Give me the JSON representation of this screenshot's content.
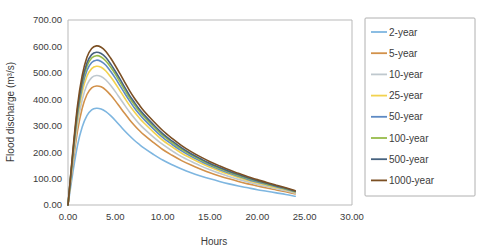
{
  "chart_data": {
    "type": "line",
    "title": "",
    "xlabel": "Hours",
    "ylabel": "Flood discharge (m³/s)",
    "xlim": [
      0,
      30
    ],
    "ylim": [
      0,
      700
    ],
    "xticks": [
      "0.00",
      "5.00",
      "10.00",
      "15.00",
      "20.00",
      "25.00",
      "30.00"
    ],
    "xtick_values": [
      0,
      5,
      10,
      15,
      20,
      25,
      30
    ],
    "yticks": [
      "0.00",
      "100.00",
      "200.00",
      "300.00",
      "400.00",
      "500.00",
      "600.00",
      "700.00"
    ],
    "ytick_values": [
      0,
      100,
      200,
      300,
      400,
      500,
      600,
      700
    ],
    "grid": false,
    "legend_position": "right",
    "x": [
      0.0,
      0.5,
      1.0,
      1.5,
      2.0,
      2.5,
      3.0,
      3.5,
      4.0,
      4.5,
      5.0,
      5.5,
      6.0,
      6.5,
      7.0,
      7.5,
      8.0,
      9.0,
      10.0,
      11.0,
      12.0,
      13.0,
      14.0,
      15.0,
      16.0,
      17.0,
      18.0,
      19.0,
      20.0,
      21.0,
      22.0,
      23.0,
      24.0
    ],
    "series": [
      {
        "name": "2-year",
        "color": "#7eb6e0",
        "values": [
          0,
          120,
          225,
          295,
          338,
          360,
          366,
          363,
          353,
          338,
          320,
          300,
          280,
          262,
          245,
          230,
          216,
          192,
          170,
          152,
          136,
          122,
          110,
          99,
          89,
          80,
          72,
          65,
          58,
          52,
          46,
          40,
          33
        ]
      },
      {
        "name": "5-year",
        "color": "#d2914a",
        "values": [
          0,
          150,
          280,
          366,
          418,
          443,
          450,
          447,
          435,
          416,
          394,
          370,
          346,
          323,
          302,
          283,
          266,
          237,
          210,
          188,
          168,
          151,
          136,
          122,
          110,
          99,
          89,
          80,
          72,
          64,
          57,
          50,
          42
        ]
      },
      {
        "name": "10-year",
        "color": "#bfc8ce",
        "values": [
          0,
          163,
          305,
          398,
          455,
          482,
          490,
          486,
          473,
          453,
          429,
          403,
          377,
          352,
          329,
          308,
          290,
          258,
          229,
          205,
          183,
          165,
          148,
          133,
          120,
          108,
          97,
          87,
          78,
          70,
          62,
          54,
          45
        ]
      },
      {
        "name": "25-year",
        "color": "#f2d24f",
        "values": [
          0,
          175,
          327,
          427,
          487,
          516,
          525,
          521,
          507,
          485,
          460,
          432,
          404,
          377,
          353,
          331,
          311,
          277,
          245,
          220,
          196,
          177,
          159,
          143,
          129,
          116,
          104,
          93,
          83,
          75,
          66,
          58,
          48
        ]
      },
      {
        "name": "50-year",
        "color": "#5e8ac4",
        "values": [
          0,
          182,
          341,
          446,
          509,
          539,
          548,
          543,
          529,
          506,
          480,
          451,
          422,
          394,
          368,
          345,
          325,
          289,
          256,
          229,
          205,
          184,
          166,
          149,
          134,
          121,
          109,
          97,
          87,
          78,
          69,
          60,
          50
        ]
      },
      {
        "name": "100-year",
        "color": "#97bb4a",
        "values": [
          0,
          188,
          352,
          460,
          525,
          556,
          565,
          560,
          545,
          522,
          495,
          465,
          435,
          406,
          380,
          356,
          335,
          298,
          264,
          236,
          211,
          190,
          171,
          154,
          138,
          125,
          112,
          100,
          90,
          80,
          71,
          62,
          51
        ]
      },
      {
        "name": "500-year",
        "color": "#46627f",
        "values": [
          0,
          192,
          360,
          470,
          537,
          569,
          578,
          573,
          558,
          534,
          506,
          476,
          445,
          415,
          389,
          364,
          343,
          305,
          270,
          242,
          216,
          194,
          175,
          157,
          142,
          128,
          115,
          103,
          92,
          82,
          72,
          63,
          52
        ]
      },
      {
        "name": "1000-year",
        "color": "#7b4f23",
        "values": [
          0,
          200,
          375,
          490,
          559,
          592,
          602,
          597,
          581,
          556,
          527,
          496,
          464,
          433,
          405,
          380,
          357,
          318,
          282,
          252,
          225,
          202,
          182,
          164,
          148,
          133,
          120,
          107,
          96,
          85,
          75,
          65,
          54
        ]
      }
    ]
  },
  "colors": {
    "frame": "#b9b9b9",
    "text": "#3b3b3b",
    "legend_border": "#b0b0b0",
    "background": "#ffffff"
  }
}
